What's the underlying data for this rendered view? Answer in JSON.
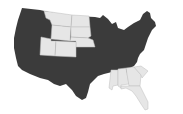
{
  "map": {
    "title": "United States",
    "colors": {
      "dark": "#3b3b3b",
      "light": "#e6e6e6",
      "border": "#bdbdbd",
      "background": "#ffffff"
    },
    "light_states": [
      "Montana",
      "North Dakota",
      "South Dakota",
      "Wyoming",
      "Nebraska",
      "Utah",
      "Colorado",
      "Mississippi",
      "Alabama",
      "Georgia",
      "South Carolina",
      "Florida"
    ],
    "dark_states_note": "All other contiguous states"
  }
}
